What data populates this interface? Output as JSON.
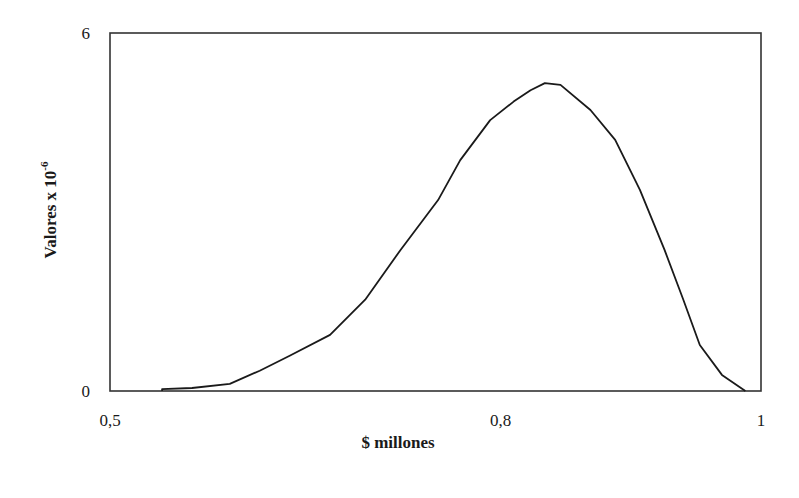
{
  "chart_data": {
    "type": "line",
    "title": "",
    "xlabel": "$ millones",
    "ylabel": "Valores x 10",
    "ylabel_superscript": "-6",
    "xlim": [
      0.5,
      1.0
    ],
    "ylim": [
      0,
      6
    ],
    "x_ticks": [
      {
        "value": 0.5,
        "label": "0,5"
      },
      {
        "value": 0.8,
        "label": "0,8"
      },
      {
        "value": 1.0,
        "label": "1"
      }
    ],
    "y_ticks": [
      {
        "value": 0,
        "label": "0"
      },
      {
        "value": 6,
        "label": "6"
      }
    ],
    "grid": false,
    "legend": null,
    "series": [
      {
        "name": "density",
        "color": "#1a1a1a",
        "x": [
          0.54,
          0.563,
          0.592,
          0.615,
          0.638,
          0.669,
          0.696,
          0.723,
          0.752,
          0.769,
          0.792,
          0.81,
          0.823,
          0.834,
          0.846,
          0.869,
          0.888,
          0.907,
          0.926,
          0.94,
          0.953,
          0.97,
          0.988
        ],
        "y": [
          0.03,
          0.05,
          0.12,
          0.34,
          0.59,
          0.94,
          1.53,
          2.36,
          3.2,
          3.87,
          4.54,
          4.85,
          5.04,
          5.16,
          5.13,
          4.71,
          4.21,
          3.37,
          2.36,
          1.55,
          0.77,
          0.27,
          0.0
        ]
      }
    ]
  }
}
